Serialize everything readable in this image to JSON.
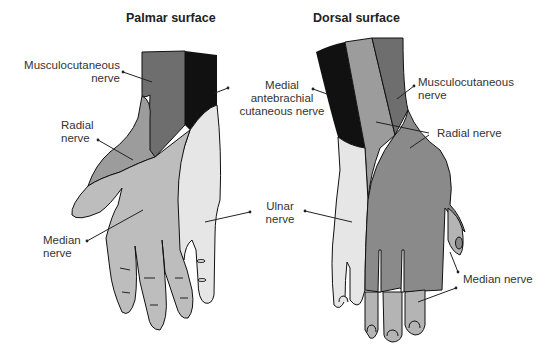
{
  "titles": {
    "palmar": "Palmar surface",
    "dorsal": "Dorsal surface"
  },
  "palmar": {
    "musculocutaneous": [
      "Musculocutaneous",
      "nerve"
    ],
    "radial": [
      "Radial",
      "nerve"
    ],
    "median": [
      "Median",
      "nerve"
    ]
  },
  "shared": {
    "medial_antebrachial": [
      "Medial",
      "antebrachial",
      "cutaneous nerve"
    ],
    "ulnar": [
      "Ulnar",
      "nerve"
    ]
  },
  "dorsal": {
    "musculocutaneous": [
      "Musculocutaneous",
      "nerve"
    ],
    "radial": "Radial nerve",
    "median": "Median nerve"
  },
  "colors": {
    "musculocutaneous": "#6e6e6e",
    "medial_antebrachial": "#111111",
    "radial": "#9c9c9c",
    "median_palmar": "#bdbdbd",
    "ulnar": "#e6e6e6",
    "radial_dorsal": "#8a8a8a",
    "median_dorsal": "#b4b4b4",
    "outline": "#111111"
  }
}
